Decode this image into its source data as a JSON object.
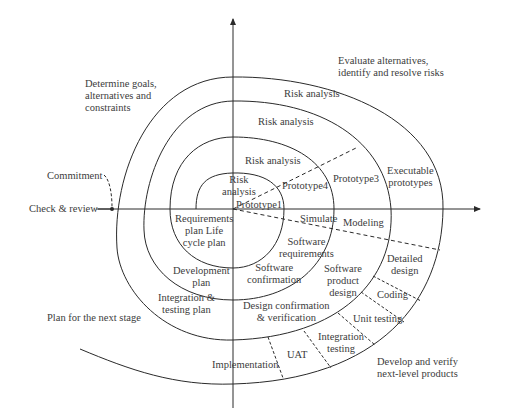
{
  "diagram": {
    "quadrants": {
      "top_left": "Determine goals,\nalternatives and\nconstraints",
      "top_right": "Evaluate alternatives,\nidentify and resolve risks",
      "bottom_left": "Plan for the next stage",
      "bottom_right": "Develop and verify\nnext-level products"
    },
    "left_labels": {
      "commitment": "Commitment",
      "check_review": "Check & review"
    },
    "risk_analysis": [
      "Risk analysis",
      "Risk analysis",
      "Risk analysis",
      "Risk\nanalysis"
    ],
    "prototypes": {
      "p1": "Prototype1",
      "p4": "Prototype4",
      "p3": "Prototype3",
      "executable": "Executable\nprototypes"
    },
    "simulation": {
      "simulate": "Simulate",
      "modeling": "Modeling"
    },
    "planning": {
      "requirements": "Requirements\nplan Life\ncycle plan",
      "development": "Development\nplan",
      "integration": "Integration &\ntesting plan"
    },
    "development": {
      "software_requirements": "Software\nrequirements",
      "software_confirmation": "Software\nconfirmation",
      "software_product_design": "Software\nproduct\ndesign",
      "design_confirmation": "Design confirmation\n& verification",
      "detailed_design": "Detailed\ndesign",
      "coding": "Coding",
      "unit_testing": "Unit testing",
      "integration_testing": "Integration\ntesting",
      "uat": "UAT",
      "implementation": "Implementation"
    },
    "colors": {
      "line": "#2a2a2a",
      "text": "#3c3c3c",
      "background": "#ffffff"
    }
  }
}
